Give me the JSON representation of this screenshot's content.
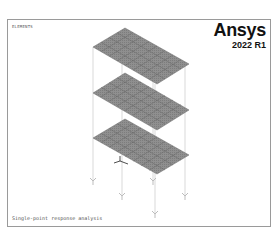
{
  "viewport": {
    "title": "ELEMENTS",
    "subtitle": "",
    "brand": {
      "name": "Ansys",
      "version": "2022 R1"
    },
    "caption": "Single-point response analysis"
  },
  "model": {
    "plates": 3,
    "plate_color": "#8c8c8c",
    "mesh_line_color": "#5a5a5a",
    "column_color": "#c8c8c8",
    "support_count": 5
  },
  "colors": {
    "border": "#9a9a9a",
    "background": "#ffffff",
    "text": "#555555"
  }
}
